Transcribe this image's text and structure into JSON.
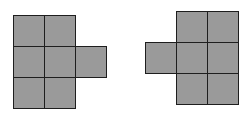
{
  "figure": {
    "cell_size": 31,
    "fill_color": "#9a9a9a",
    "border_color": "#1e1e1e",
    "shapes": [
      {
        "name": "left-shape",
        "origin": [
          13,
          15
        ],
        "cells": [
          [
            0,
            0
          ],
          [
            1,
            0
          ],
          [
            0,
            1
          ],
          [
            1,
            1
          ],
          [
            2,
            1
          ],
          [
            0,
            2
          ],
          [
            1,
            2
          ]
        ]
      },
      {
        "name": "right-shape",
        "origin": [
          145,
          11
        ],
        "cells": [
          [
            1,
            0
          ],
          [
            2,
            0
          ],
          [
            0,
            1
          ],
          [
            1,
            1
          ],
          [
            2,
            1
          ],
          [
            1,
            2
          ],
          [
            2,
            2
          ]
        ]
      }
    ]
  }
}
